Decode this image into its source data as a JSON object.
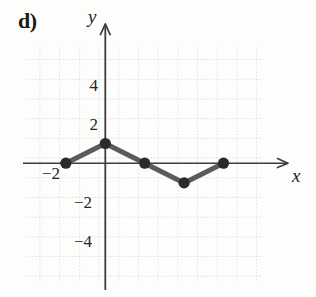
{
  "figure": {
    "part_label": "d)",
    "x_axis_label": "x",
    "y_axis_label": "y"
  },
  "ticks": {
    "y_pos_4": "4",
    "y_pos_2": "2",
    "y_neg_2": "−2",
    "y_neg_4": "−4",
    "x_neg_2": "−2"
  },
  "colors": {
    "curve": "#5b5b5b",
    "point": "#2a2a2a",
    "axis": "#3d3d3d",
    "grid": "#d8d8d4",
    "background": "#fdfdfc",
    "text": "#1d1d1d"
  },
  "chart_data": {
    "type": "line",
    "title": "d)",
    "xlabel": "x",
    "ylabel": "y",
    "xlim": [
      -4,
      8
    ],
    "ylim": [
      -5,
      6
    ],
    "grid": true,
    "legend": "none",
    "x_ticks": [
      -2
    ],
    "y_ticks": [
      -4,
      -2,
      2,
      4
    ],
    "series": [
      {
        "name": "piecewise-linear",
        "marker": "filled-circle",
        "x": [
          -2,
          0,
          2,
          4,
          6
        ],
        "y": [
          0,
          1,
          0,
          -1,
          0
        ],
        "points": [
          {
            "x": -2,
            "y": 0
          },
          {
            "x": 0,
            "y": 1
          },
          {
            "x": 2,
            "y": 0
          },
          {
            "x": 4,
            "y": -1
          },
          {
            "x": 6,
            "y": 0
          }
        ]
      }
    ],
    "annotations": []
  }
}
